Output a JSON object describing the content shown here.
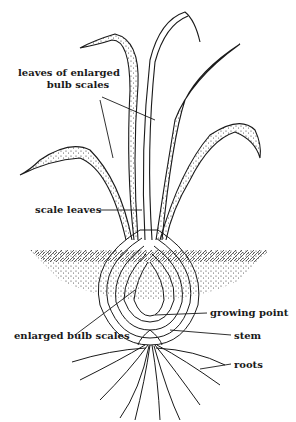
{
  "diagram": {
    "labels": {
      "leaves_line1": "leaves of enlarged",
      "leaves_line2": "bulb scales",
      "scale_leaves": "scale leaves",
      "growing_point": "growing point",
      "enlarged_bulb_scales": "enlarged bulb scales",
      "stem": "stem",
      "roots": "roots"
    },
    "colors": {
      "ink": "#1a1a1a",
      "background": "#ffffff"
    }
  }
}
